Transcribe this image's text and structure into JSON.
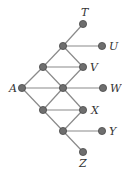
{
  "diagram": {
    "type": "graph",
    "nodes": [
      {
        "id": "T",
        "label": "T",
        "x": 83,
        "y": 24,
        "lx": 81,
        "ly": 16
      },
      {
        "id": "n1",
        "label": "",
        "x": 63,
        "y": 46
      },
      {
        "id": "U",
        "label": "U",
        "x": 102,
        "y": 46,
        "lx": 109,
        "ly": 50
      },
      {
        "id": "n2",
        "label": "",
        "x": 43,
        "y": 67
      },
      {
        "id": "V",
        "label": "V",
        "x": 83,
        "y": 67,
        "lx": 90,
        "ly": 71
      },
      {
        "id": "A",
        "label": "A",
        "x": 22,
        "y": 88,
        "lx": 9,
        "ly": 92
      },
      {
        "id": "n3",
        "label": "",
        "x": 63,
        "y": 88
      },
      {
        "id": "W",
        "label": "W",
        "x": 103,
        "y": 88,
        "lx": 110,
        "ly": 92
      },
      {
        "id": "n4",
        "label": "",
        "x": 43,
        "y": 110
      },
      {
        "id": "X",
        "label": "X",
        "x": 83,
        "y": 110,
        "lx": 91,
        "ly": 114
      },
      {
        "id": "n5",
        "label": "",
        "x": 63,
        "y": 131
      },
      {
        "id": "Y",
        "label": "Y",
        "x": 102,
        "y": 131,
        "lx": 109,
        "ly": 135
      },
      {
        "id": "Z",
        "label": "Z",
        "x": 83,
        "y": 152,
        "lx": 79,
        "ly": 167
      }
    ],
    "edges": [
      [
        "n1",
        "T"
      ],
      [
        "n1",
        "U"
      ],
      [
        "n1",
        "n2"
      ],
      [
        "n1",
        "V"
      ],
      [
        "n2",
        "V"
      ],
      [
        "n2",
        "A"
      ],
      [
        "n2",
        "n3"
      ],
      [
        "V",
        "n3"
      ],
      [
        "A",
        "n3"
      ],
      [
        "n3",
        "W"
      ],
      [
        "A",
        "n4"
      ],
      [
        "n3",
        "n4"
      ],
      [
        "n3",
        "X"
      ],
      [
        "n4",
        "X"
      ],
      [
        "n4",
        "n5"
      ],
      [
        "X",
        "n5"
      ],
      [
        "n5",
        "Y"
      ],
      [
        "n5",
        "Z"
      ]
    ],
    "colors": {
      "edge": "#8a8a8a",
      "node": "#6e6e6e",
      "label": "#333333"
    }
  }
}
